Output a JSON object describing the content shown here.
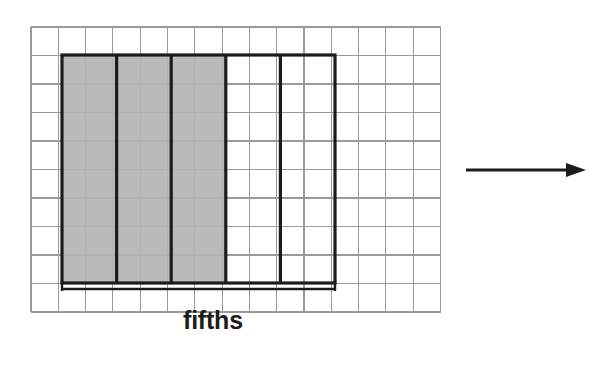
{
  "figure": {
    "background_color": "#ffffff",
    "caption": {
      "label": "fifths",
      "x": 183,
      "y": 306,
      "color": "#1c1c1c"
    },
    "grid": {
      "line_color": "#9a9a9a",
      "origin_x": 31,
      "origin_y": 27,
      "cell_width": 27.3,
      "cell_height": 28.5,
      "columns": 15,
      "rows": 10
    },
    "rectangle": {
      "outline_color": "#1c1c1c",
      "x": 62,
      "y": 55,
      "width": 273,
      "height": 228,
      "cells_wide": 10,
      "cells_tall": 8,
      "parts_label": "fifths",
      "total_parts": 5,
      "shaded_parts": 3,
      "shaded_fraction": "3/5",
      "strip_fill_color": "#b4b4b4",
      "strips": [
        {
          "index": 1,
          "shaded": true
        },
        {
          "index": 2,
          "shaded": true
        },
        {
          "index": 3,
          "shaded": true
        },
        {
          "index": 4,
          "shaded": false
        },
        {
          "index": 5,
          "shaded": false
        }
      ]
    },
    "bracket": {
      "x_start": 62,
      "x_end": 335,
      "y": 289,
      "tick_height": 9,
      "color": "#1c1c1c",
      "labels_span": "fifths"
    },
    "arrow": {
      "name": "right-arrow",
      "x_start": 466,
      "x_end": 586,
      "y": 170,
      "color": "#1c1c1c",
      "direction": "right"
    }
  }
}
